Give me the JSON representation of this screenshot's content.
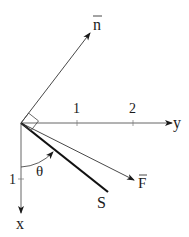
{
  "diagram": {
    "axes": {
      "y_label": "y",
      "x_label": "x",
      "y_ticks": [
        "1",
        "2"
      ],
      "x_ticks": [
        "1"
      ]
    },
    "vectors": {
      "normal_label": "n",
      "force_label": "F"
    },
    "surface_label": "S",
    "angle_label": "θ",
    "colors": {
      "line": "#1a1a1a",
      "axis": "#555555",
      "background": "#ffffff"
    }
  }
}
